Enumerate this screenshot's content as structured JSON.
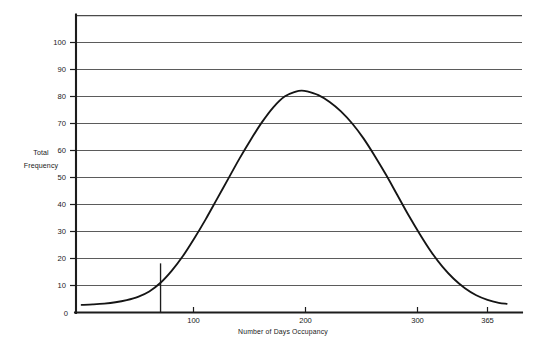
{
  "chart_data": {
    "type": "line",
    "title": "",
    "subtitle": "",
    "xlabel": "Number of Days Occupancy",
    "ylabel_line1": "Total",
    "ylabel_line2": "Frequency",
    "ylabel": "Total Frequency",
    "grid": true,
    "legend": "none",
    "xlim": [
      0,
      385
    ],
    "ylim": [
      0,
      110
    ],
    "x_tick_labels": [
      "100",
      "200",
      "300",
      "365"
    ],
    "x_tick_values": [
      100,
      200,
      300,
      365
    ],
    "y_tick_labels": [
      "0",
      "10",
      "20",
      "30",
      "40",
      "50",
      "60",
      "70",
      "80",
      "90",
      "100"
    ],
    "y_tick_values": [
      0,
      10,
      20,
      30,
      40,
      50,
      60,
      70,
      80,
      90,
      100
    ],
    "y_gridline_values": [
      10,
      20,
      30,
      40,
      50,
      60,
      70,
      80,
      90,
      100,
      110
    ],
    "series": [
      {
        "name": "Total Frequency",
        "x": [
          5,
          15,
          25,
          35,
          45,
          55,
          65,
          75,
          85,
          95,
          105,
          115,
          125,
          135,
          145,
          155,
          165,
          175,
          185,
          195,
          200,
          205,
          215,
          225,
          235,
          245,
          255,
          265,
          275,
          285,
          295,
          305,
          315,
          325,
          335,
          345,
          355,
          365,
          375,
          382
        ],
        "values": [
          2.8,
          3.0,
          3.3,
          3.8,
          4.6,
          5.8,
          7.8,
          11.0,
          15.5,
          21.0,
          27.5,
          34.5,
          42.0,
          49.5,
          57.0,
          64.0,
          70.5,
          76.0,
          80.0,
          81.8,
          82.2,
          81.9,
          80.5,
          78.0,
          74.5,
          70.0,
          64.5,
          58.0,
          51.0,
          43.5,
          36.0,
          29.0,
          22.5,
          17.0,
          12.5,
          9.0,
          6.4,
          4.7,
          3.6,
          3.2
        ]
      }
    ],
    "annotation": {
      "name": "reference-line",
      "x_value": 75,
      "y_value": 18.2,
      "description": "vertical reference line from axis to curve"
    },
    "peak": {
      "x": 200,
      "y": 82
    },
    "colors": {
      "curve": "#151515",
      "grid": "#5b5b5b",
      "axis": "#1c1c1c",
      "background": "#ffffff",
      "text": "#1a1a1a"
    }
  }
}
